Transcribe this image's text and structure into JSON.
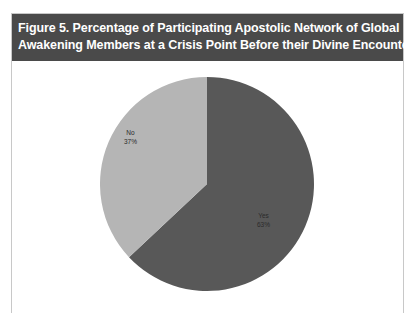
{
  "figure": {
    "title_line1": "Figure 5. Percentage of Participating Apostolic Network of Global",
    "title_line2": "Awakening Members at a Crisis Point Before their Divine Encounter",
    "title_bg": "#4a4a4a",
    "title_color": "#ffffff",
    "border_color": "#c8c8c8",
    "background": "#ffffff"
  },
  "chart_data": {
    "type": "pie",
    "title": "Figure 5. Percentage of Participating Apostolic Network of Global Awakening Members at a Crisis Point Before their Divine Encounter",
    "xlabel": "",
    "ylabel": "",
    "legend": "none",
    "grid": false,
    "start_angle_deg": 0,
    "direction": "clockwise",
    "categories": [
      "Yes",
      "No"
    ],
    "values": [
      63,
      37
    ],
    "unit": "%",
    "slices": [
      {
        "label": "Yes",
        "value": 63,
        "value_text": "63%",
        "color": "#585858",
        "label_color": "#2b2b2b"
      },
      {
        "label": "No",
        "value": 37,
        "value_text": "37%",
        "color": "#b5b5b5",
        "label_color": "#2b2b2b"
      }
    ]
  }
}
